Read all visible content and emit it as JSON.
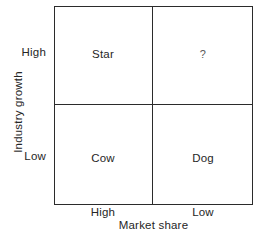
{
  "chart_data": {
    "type": "table",
    "title": "",
    "xlabel": "Market share",
    "ylabel": "Industry growth",
    "x_categories": [
      "High",
      "Low"
    ],
    "y_categories": [
      "High",
      "Low"
    ],
    "grid": true,
    "legend": "none",
    "cells": [
      {
        "row": "High",
        "col": "High",
        "label": "Star"
      },
      {
        "row": "High",
        "col": "Low",
        "label": "?"
      },
      {
        "row": "Low",
        "col": "High",
        "label": "Cow"
      },
      {
        "row": "Low",
        "col": "Low",
        "label": "Dog"
      }
    ],
    "colors": {
      "line": "#2b2b2b",
      "text": "#262626",
      "background": "#ffffff"
    }
  },
  "axes": {
    "y": {
      "title": "Industry growth",
      "tick_high": "High",
      "tick_low": "Low"
    },
    "x": {
      "title": "Market share",
      "tick_high": "High",
      "tick_low": "Low"
    }
  },
  "quadrants": {
    "top_left": "Star",
    "top_right": "?",
    "bottom_left": "Cow",
    "bottom_right": "Dog"
  }
}
